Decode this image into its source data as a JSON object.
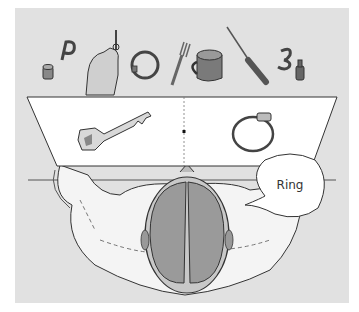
{
  "figure": {
    "speech_bubble": {
      "text": "Ring"
    },
    "screen": {
      "left_image": "key",
      "right_image": "ring",
      "fixation_point": "dot"
    },
    "table_objects": [
      "cylinder",
      "letter-p",
      "key-in-hand",
      "bracelet",
      "fork",
      "mug",
      "screwdriver",
      "number-3",
      "bottle"
    ],
    "colors": {
      "background": "#e1e1e1",
      "screen": "#ffffff",
      "outline": "#333333",
      "brain": "#9a9a9a"
    }
  }
}
